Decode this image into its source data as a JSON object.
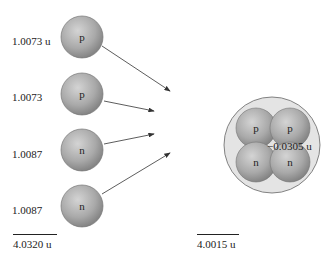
{
  "figure": {
    "separate_particles": [
      {
        "symbol": "p",
        "mass_label": "1.0073 u"
      },
      {
        "symbol": "p",
        "mass_label": "1.0073"
      },
      {
        "symbol": "n",
        "mass_label": "1.0087"
      },
      {
        "symbol": "n",
        "mass_label": "1.0087"
      }
    ],
    "separate_total": "4.0320 u",
    "nucleus": {
      "particles": [
        "p",
        "p",
        "n",
        "n"
      ],
      "total": "4.0015 u"
    },
    "mass_defect": "−0.0305 u",
    "colors": {
      "sphere": "#a8a8a8",
      "sphere_edge": "#6e6e6e",
      "nucleus_bg": "#e4e4e4",
      "arrow": "#333333"
    }
  }
}
